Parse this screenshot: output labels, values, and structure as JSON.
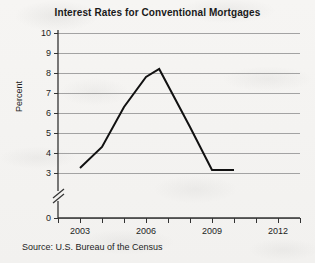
{
  "chart_data": {
    "type": "line",
    "title": "Interest Rates for Conventional Mortgages",
    "xlabel": "",
    "ylabel": "Percent",
    "source": "Source: U.S. Bureau of the Census",
    "grid": true,
    "legend": "none",
    "y_axis_break": true,
    "y_break_note": "axis broken between 0 and 3",
    "xlim": [
      2002,
      2013
    ],
    "ylim": [
      3,
      10
    ],
    "y_ticks": [
      0,
      3,
      4,
      5,
      6,
      7,
      8,
      9,
      10
    ],
    "y_tick_labels": [
      "0",
      "3",
      "4",
      "5",
      "6",
      "7",
      "8",
      "9",
      "10"
    ],
    "x_ticks": [
      2002,
      2003,
      2004,
      2005,
      2006,
      2007,
      2008,
      2009,
      2010,
      2011,
      2012,
      2013
    ],
    "x_tick_labels": [
      "2003",
      "2006",
      "2009",
      "2012"
    ],
    "x_labeled_ticks": [
      2003,
      2006,
      2009,
      2012
    ],
    "series": [
      {
        "name": "Interest rate",
        "x": [
          2003,
          2004,
          2005,
          2006,
          2006.6,
          2008,
          2009,
          2010
        ],
        "values": [
          3.25,
          4.3,
          6.3,
          7.8,
          8.2,
          5.3,
          3.15,
          3.15
        ]
      }
    ],
    "line_color": "#111111",
    "grid_color": "#9a9a9a"
  }
}
